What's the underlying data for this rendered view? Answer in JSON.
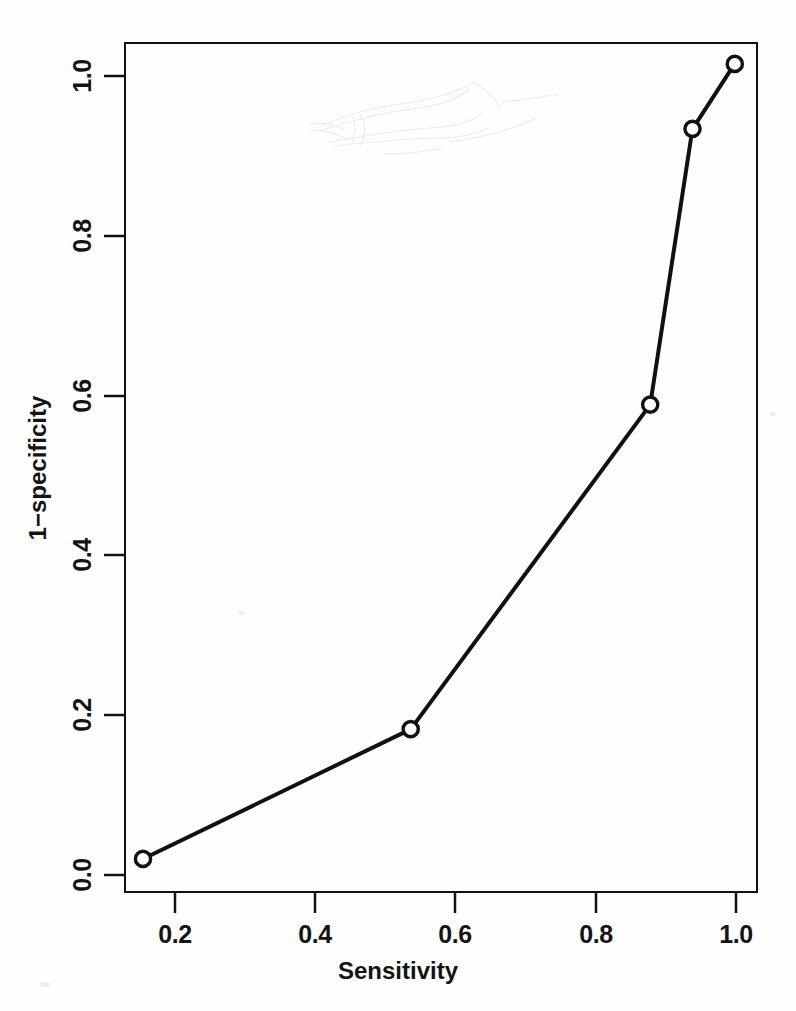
{
  "chart_data": {
    "type": "line",
    "title": "",
    "subtitle": "",
    "xlabel": "Sensitivity",
    "ylabel": "1−specificity",
    "xlim": [
      0.133,
      1.033
    ],
    "ylim": [
      -0.022,
      1.027
    ],
    "xticks": [
      0.2,
      0.4,
      0.6,
      0.8,
      1.0
    ],
    "xticklabels": [
      "0.2",
      "0.4",
      "0.6",
      "0.8",
      "1.0"
    ],
    "yticks": [
      0.0,
      0.2,
      0.4,
      0.6,
      0.8,
      1.0
    ],
    "yticklabels": [
      "0.0",
      "0.2",
      "0.4",
      "0.6",
      "0.8",
      "1.0"
    ],
    "grid": false,
    "legend": false,
    "legend_position": "none",
    "marker": "circle-open",
    "line_color": "#111111",
    "marker_color": "#111111",
    "background_color": "#ffffff",
    "series": [
      {
        "name": "ROC curve",
        "x": [
          0.16,
          0.54,
          0.88,
          0.94,
          1.0
        ],
        "y": [
          0.02,
          0.18,
          0.58,
          0.92,
          1.0
        ],
        "points": [
          {
            "x": 0.16,
            "y": 0.02
          },
          {
            "x": 0.54,
            "y": 0.18
          },
          {
            "x": 0.88,
            "y": 0.58
          },
          {
            "x": 0.94,
            "y": 0.92
          },
          {
            "x": 1.0,
            "y": 1.0
          }
        ]
      }
    ],
    "annotations": []
  },
  "axes": {
    "x_title": "Sensitivity",
    "y_title": "1−specificity",
    "x_tick_labels": [
      "0.2",
      "0.4",
      "0.6",
      "0.8",
      "1.0"
    ],
    "y_tick_labels": [
      "0.0",
      "0.2",
      "0.4",
      "0.6",
      "0.8",
      "1.0"
    ]
  },
  "colors": {
    "line": "#111111",
    "frame": "#111111",
    "text": "#141414",
    "page_background": "#ffffff",
    "artifact": "#b9bfd0"
  }
}
